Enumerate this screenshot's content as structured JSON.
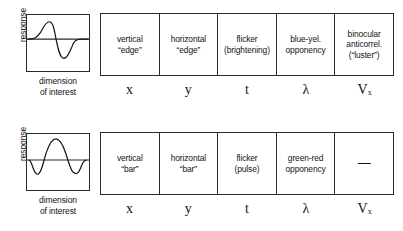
{
  "figure": {
    "axes": {
      "y_label": "response",
      "x_label_line1": "dimension",
      "x_label_line2": "of interest"
    },
    "rows": [
      {
        "id": "odd-symmetric-edge-row",
        "waveform": "odd-symmetric-derivative-of-gaussian",
        "cells": [
          {
            "label": "vertical\n“edge”",
            "symbol": "x",
            "symbol_sub": ""
          },
          {
            "label": "horizontal\n“edge”",
            "symbol": "y",
            "symbol_sub": ""
          },
          {
            "label": "flicker\n(brightening)",
            "symbol": "t",
            "symbol_sub": ""
          },
          {
            "label": "blue-yel.\nopponency",
            "symbol": "λ",
            "symbol_sub": ""
          },
          {
            "label": "binocular\nanticorrel.\n(“luster”)",
            "symbol": "V",
            "symbol_sub": "x"
          }
        ]
      },
      {
        "id": "even-symmetric-bar-row",
        "waveform": "even-symmetric-mexican-hat",
        "cells": [
          {
            "label": "vertical\n“bar”",
            "symbol": "x",
            "symbol_sub": ""
          },
          {
            "label": "horizontal\n“bar”",
            "symbol": "y",
            "symbol_sub": ""
          },
          {
            "label": "flicker\n(pulse)",
            "symbol": "t",
            "symbol_sub": ""
          },
          {
            "label": "green-red\nopponency",
            "symbol": "λ",
            "symbol_sub": ""
          },
          {
            "label": "—",
            "symbol": "V",
            "symbol_sub": "x"
          }
        ]
      }
    ],
    "colors": {
      "ink": "#141414",
      "stroke": "#2b2b2b",
      "background": "#ffffff"
    }
  }
}
